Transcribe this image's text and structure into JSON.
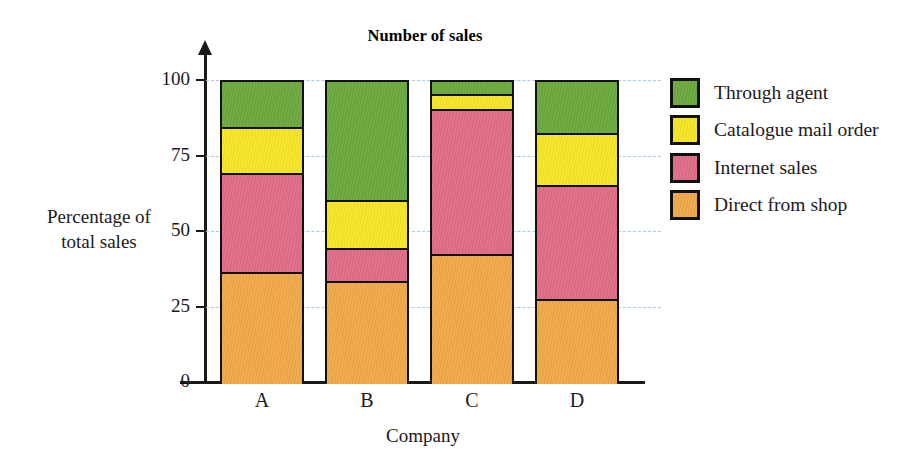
{
  "chart_data": {
    "type": "bar",
    "title": "Number of sales",
    "xlabel": "Company",
    "ylabel": "Percentage of\ntotal sales",
    "ylabel_line1": "Percentage of",
    "ylabel_line2": "total sales",
    "categories": [
      "A",
      "B",
      "C",
      "D"
    ],
    "ylim": [
      0,
      100
    ],
    "yticks": [
      0,
      25,
      50,
      75,
      100
    ],
    "ytick_labels": [
      "0",
      "25",
      "50",
      "75",
      "100"
    ],
    "grid": true,
    "grid_color": "#a8cbe8",
    "stacked": true,
    "stack_order_bottom_to_top": [
      "Direct from shop",
      "Internet sales",
      "Catalogue mail order",
      "Through agent"
    ],
    "legend_position": "right",
    "series": [
      {
        "name": "Through agent",
        "color": "#6aa83a",
        "values": [
          15,
          39,
          4,
          17
        ]
      },
      {
        "name": "Catalogue mail order",
        "color": "#f5e525",
        "values": [
          15,
          16,
          5,
          17
        ]
      },
      {
        "name": "Internet sales",
        "color": "#df6b86",
        "values": [
          33,
          11,
          48,
          38
        ]
      },
      {
        "name": "Direct from shop",
        "color": "#f0a848",
        "values": [
          37,
          34,
          43,
          28
        ]
      }
    ],
    "cumulative_tops": {
      "A": [
        37,
        70,
        85,
        100
      ],
      "B": [
        34,
        45,
        61,
        100
      ],
      "C": [
        43,
        91,
        96,
        100
      ],
      "D": [
        28,
        66,
        83,
        100
      ]
    }
  }
}
